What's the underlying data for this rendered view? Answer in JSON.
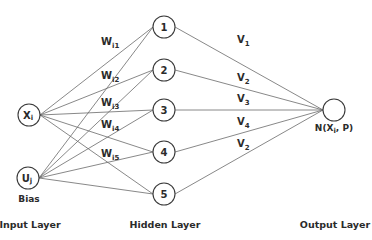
{
  "diagram": {
    "type": "neural-network",
    "input_layer": {
      "label": "Input Layer",
      "nodes": [
        {
          "id": "x",
          "main": "X",
          "sub": "i",
          "cx": 29,
          "cy": 115
        },
        {
          "id": "u",
          "main": "U",
          "sub": "j",
          "cx": 28,
          "cy": 178
        }
      ],
      "bias_label": "Bias"
    },
    "hidden_layer": {
      "label": "Hidden Layer",
      "nodes": [
        {
          "id": "h1",
          "label": "1",
          "cx": 164,
          "cy": 27
        },
        {
          "id": "h2",
          "label": "2",
          "cx": 164,
          "cy": 70
        },
        {
          "id": "h3",
          "label": "3",
          "cx": 164,
          "cy": 110
        },
        {
          "id": "h4",
          "label": "4",
          "cx": 164,
          "cy": 152
        },
        {
          "id": "h5",
          "label": "5",
          "cx": 164,
          "cy": 194
        }
      ]
    },
    "output_layer": {
      "label": "Output Layer",
      "node": {
        "id": "out",
        "cx": 334,
        "cy": 110
      },
      "node_label": {
        "pre": "N(X",
        "sub": "i",
        "post": ", P)"
      }
    },
    "input_weights": [
      {
        "main": "W",
        "sub": "i1",
        "x": 101,
        "y": 45
      },
      {
        "main": "W",
        "sub": "i2",
        "x": 101,
        "y": 79
      },
      {
        "main": "W",
        "sub": "i3",
        "x": 101,
        "y": 106
      },
      {
        "main": "W",
        "sub": "i4",
        "x": 101,
        "y": 128
      },
      {
        "main": "W",
        "sub": "i5",
        "x": 101,
        "y": 157
      }
    ],
    "output_weights": [
      {
        "main": "V",
        "sub": "1",
        "x": 237,
        "y": 43
      },
      {
        "main": "V",
        "sub": "2",
        "x": 237,
        "y": 81
      },
      {
        "main": "V",
        "sub": "3",
        "x": 237,
        "y": 102
      },
      {
        "main": "V",
        "sub": "4",
        "x": 237,
        "y": 125
      },
      {
        "main": "V",
        "sub": "2",
        "x": 237,
        "y": 147
      }
    ],
    "node_radius": 11,
    "colors": {
      "edge": "#6a6a6a",
      "node_stroke": "#3a3a3a",
      "text": "#2b2b2b",
      "background": "#ffffff"
    }
  }
}
